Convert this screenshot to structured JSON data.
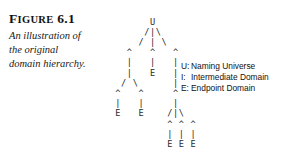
{
  "figure": {
    "label_prefix": "F",
    "label_word": "IGURE",
    "label_number": "6.1",
    "label_full": "FIGURE 6.1",
    "caption_lines": [
      "An illustration of",
      "the original",
      "domain hierarchy."
    ]
  },
  "tree": {
    "ascii": "         U\n        /|\\\n       / | \\\n     ^   ^   ^\n     |   |   |\n     |   E   |\n    / \\      |\n   ^   ^     ^\n   |   |     |\n   E   E    /|\\\n            ^ ^ ^\n            | | |\n            E E E",
    "rows": [
      "         U",
      "        /|\\",
      "       / | \\",
      "     ^   ^   ^",
      "     |   |   |",
      "     |   E   |",
      "    / \\      |",
      "   ^   ^     ^",
      "   |   |     |",
      "   E   E    /|\\",
      "            ^ ^ ^",
      "            | | |",
      "            E E E"
    ],
    "root": "U",
    "node_symbol": "^",
    "leaf_symbol": "E",
    "edge_symbols": [
      "/",
      "|",
      "\\"
    ]
  },
  "legend": {
    "items": [
      {
        "key": "U:",
        "text": "Naming Universe"
      },
      {
        "key": "I:",
        "text": "Intermediate Domain"
      },
      {
        "key": "E:",
        "text": "Endpoint Domain"
      }
    ]
  },
  "colors": {
    "background": "#ffffff",
    "text": "#111111",
    "tree_text": "#2a2a2a"
  }
}
